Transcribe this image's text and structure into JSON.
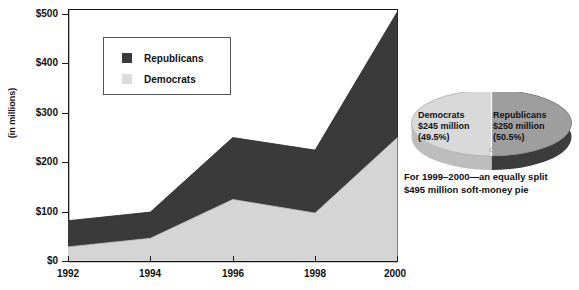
{
  "chart_data": [
    {
      "type": "area",
      "title": "",
      "subtitle": "",
      "xlabel": "",
      "ylabel": "(in millions)",
      "categories": [
        "1992",
        "1994",
        "1996",
        "1998",
        "2000"
      ],
      "x": [
        1992,
        1994,
        1996,
        1998,
        2000
      ],
      "stacked": true,
      "grid": false,
      "legend_position": "inside-top-left",
      "xlim": [
        1992,
        2000
      ],
      "ylim": [
        0,
        500
      ],
      "ytick_labels": [
        "$0",
        "$100",
        "$200",
        "$300",
        "$400",
        "$500"
      ],
      "ytick_values": [
        0,
        100,
        200,
        300,
        400,
        500
      ],
      "xtick_labels": [
        "1992",
        "1994",
        "1996",
        "1998",
        "2000"
      ],
      "series": [
        {
          "name": "Democrats",
          "color": "#d5d5d5",
          "values": [
            28,
            45,
            122,
            95,
            245
          ]
        },
        {
          "name": "Republicans",
          "color": "#3a3a3a",
          "values": [
            52,
            52,
            123,
            125,
            250
          ]
        }
      ],
      "totals": [
        80,
        97,
        245,
        220,
        495
      ]
    },
    {
      "type": "pie",
      "title": "",
      "labels": [
        "Democrats",
        "Republicans"
      ],
      "values": [
        245,
        250
      ],
      "percentages": [
        49.5,
        50.5
      ],
      "colors": [
        "#d9d9d9",
        "#9e9e9e"
      ],
      "total": 495,
      "annotation": "For 1999–2000—an equally split $495 million soft-money pie"
    }
  ],
  "axis": {
    "y_title": "(in millions)",
    "y_ticks": [
      {
        "label": "$500",
        "value": 500
      },
      {
        "label": "$400",
        "value": 400
      },
      {
        "label": "$300",
        "value": 300
      },
      {
        "label": "$200",
        "value": 200
      },
      {
        "label": "$100",
        "value": 100
      },
      {
        "label": "$0",
        "value": 0
      }
    ],
    "x_ticks": [
      {
        "label": "1992",
        "value": 1992
      },
      {
        "label": "1994",
        "value": 1994
      },
      {
        "label": "1996",
        "value": 1996
      },
      {
        "label": "1998",
        "value": 1998
      },
      {
        "label": "2000",
        "value": 2000
      }
    ]
  },
  "legend": {
    "items": [
      {
        "label": "Republicans",
        "color": "#3a3a3a"
      },
      {
        "label": "Democrats",
        "color": "#dcdcdc"
      }
    ]
  },
  "pie": {
    "democrats": {
      "name": "Democrats",
      "amount": "$245 million",
      "percent": "(49.5%)"
    },
    "republicans": {
      "name": "Republicans",
      "amount": "$250 million",
      "percent": "(50.5%)"
    },
    "caption_line1": "For 1999–2000—an equally split",
    "caption_line2": "$495 million soft-money pie"
  },
  "colors": {
    "republican": "#3a3a3a",
    "democrat": "#d5d5d5",
    "pie_left": "#d9d9d9",
    "pie_right_top": "#9e9e9e",
    "pie_right_side": "#3c3c3c",
    "axis": "#1a1a1a"
  }
}
